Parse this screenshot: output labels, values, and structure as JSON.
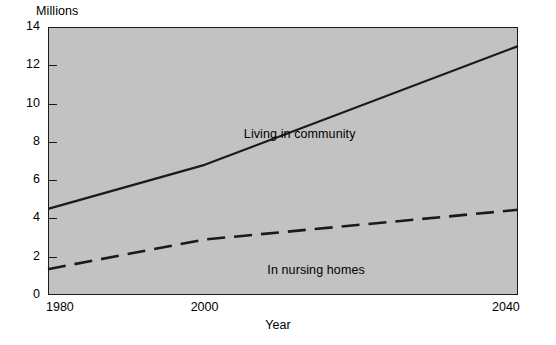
{
  "chart_data": {
    "type": "line",
    "title": "",
    "xlabel": "Year",
    "ylabel": "Millions",
    "xlim": [
      1980,
      2040
    ],
    "ylim": [
      0,
      14
    ],
    "xticks": [
      1980,
      2000,
      2040
    ],
    "xtick_labels": [
      "1980",
      "2000",
      "2040"
    ],
    "yticks": [
      0,
      2,
      4,
      6,
      8,
      10,
      12,
      14
    ],
    "ytick_labels": [
      "0",
      "2",
      "4",
      "6",
      "8",
      "10",
      "12",
      "14"
    ],
    "grid": false,
    "legend_position": "inline-annotation",
    "plot_background": "#c2c2c2",
    "line_color": "#1a1a1a",
    "series": [
      {
        "name": "Living in community",
        "style": "solid",
        "x": [
          1980,
          2000,
          2040
        ],
        "values": [
          4.5,
          6.8,
          13.0
        ],
        "label_text": "Living in community"
      },
      {
        "name": "In nursing homes",
        "style": "dashed",
        "x": [
          1980,
          2000,
          2040
        ],
        "values": [
          1.35,
          2.9,
          4.45
        ],
        "label_text": "In nursing homes"
      }
    ]
  },
  "annotations": {
    "living_in_community": "Living in community",
    "in_nursing_homes": "In nursing homes"
  },
  "axis": {
    "y_title": "Millions",
    "x_title": "Year"
  }
}
